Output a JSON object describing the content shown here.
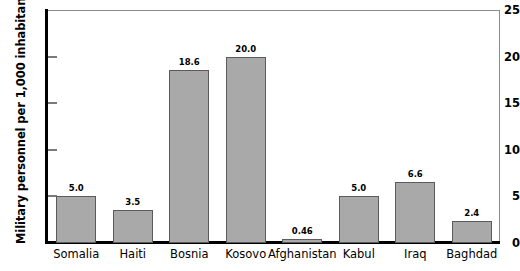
{
  "chart_data": {
    "type": "bar",
    "title": "",
    "xlabel": "",
    "ylabel": "Military personnel per 1,000 inhabitants",
    "categories": [
      "Somalia",
      "Haiti",
      "Bosnia",
      "Kosovo",
      "Afghanistan",
      "Kabul",
      "Iraq",
      "Baghdad"
    ],
    "values": [
      5.0,
      3.5,
      18.6,
      20.0,
      0.46,
      5.0,
      6.6,
      2.4
    ],
    "value_labels": [
      "5.0",
      "3.5",
      "18.6",
      "20.0",
      "0.46",
      "5.0",
      "6.6",
      "2.4"
    ],
    "ylim": [
      0,
      25
    ],
    "yticks": [
      0,
      5,
      10,
      15,
      20,
      25
    ],
    "ytick_labels": [
      "0",
      "5",
      "10",
      "15",
      "20",
      "25"
    ],
    "grid": false,
    "legend": null,
    "bar_color": "#a9a9a9",
    "bar_border_color": "#5b5b5b",
    "axis_color": "#000000"
  }
}
